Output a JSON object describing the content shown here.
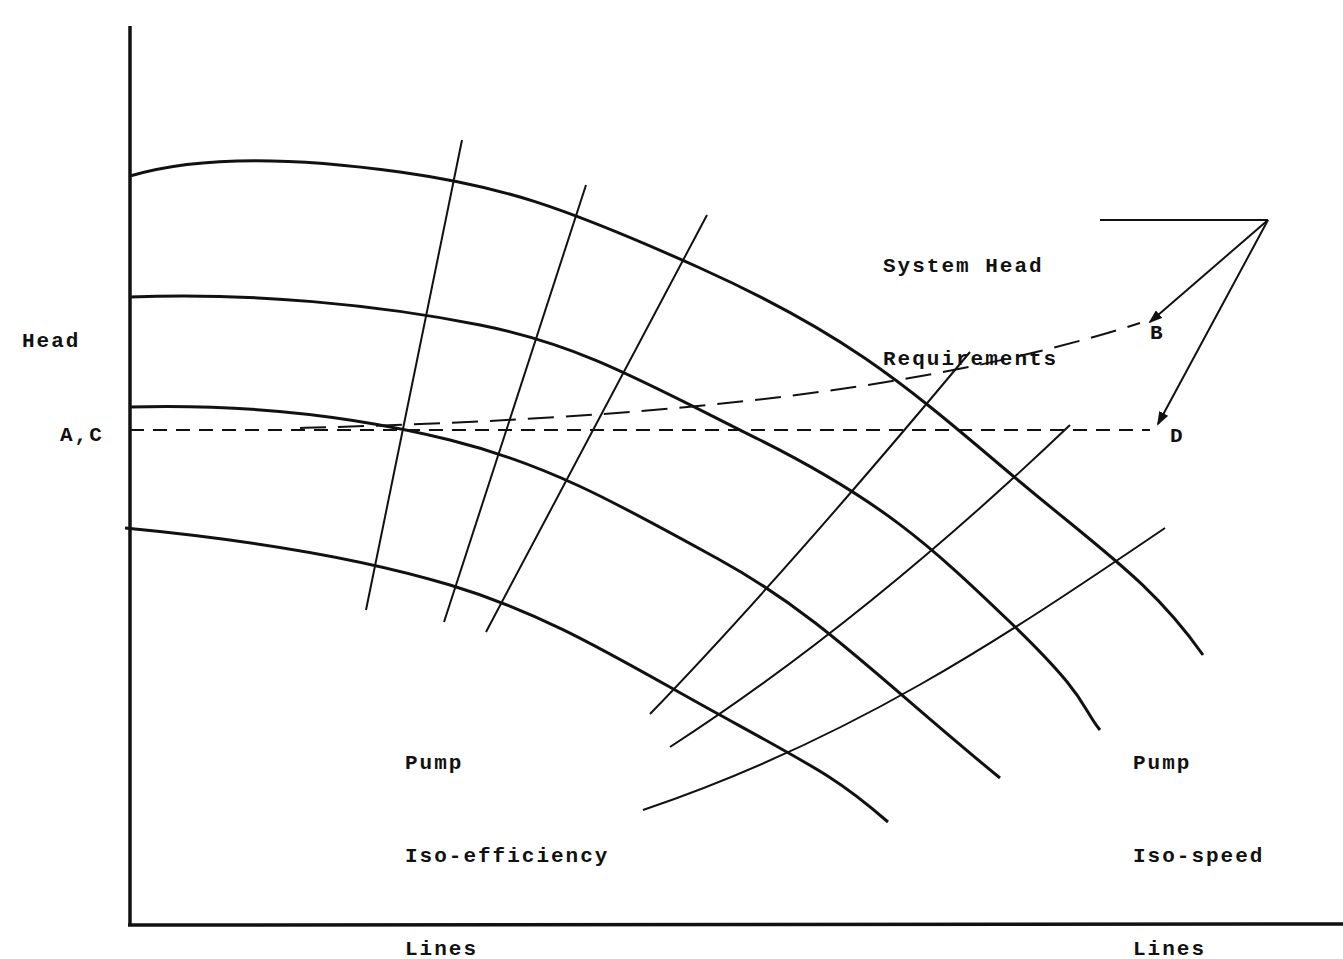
{
  "diagram": {
    "title": "",
    "axes": {
      "y_label": "Head",
      "x_label": "",
      "reference_level_label": "A,C"
    },
    "labels": {
      "system_head": [
        "System Head",
        "Requirements"
      ],
      "iso_efficiency": [
        "Pump",
        "Iso-efficiency",
        "Lines"
      ],
      "iso_speed": [
        "Pump",
        "Iso-speed",
        "Lines"
      ],
      "point_b": "B",
      "point_d": "D"
    },
    "colors": {
      "ink": "#111111",
      "background": "#ffffff"
    },
    "curves": {
      "iso_speed": [
        "M130,176 C200,155 300,158 400,172 S560,205 700,268 S900,380 1000,465 S1150,580 1203,655",
        "M130,297 C250,292 380,305 480,325 S640,380 760,440 S930,545 1010,622 S1080,705 1100,730",
        "M130,407 C240,404 350,415 450,440 S620,505 720,560 S880,680 1000,778",
        "M125,528 C230,538 350,555 450,585 S620,660 720,715 S840,780 888,822"
      ],
      "iso_efficiency": [
        "M462,140 L366,610",
        "M586,185 L444,622",
        "M707,215 L486,632",
        "M970,352 C880,460 760,600 650,714",
        "M1070,425 C960,530 820,650 670,747",
        "M1165,528 C1000,640 850,740 643,810"
      ],
      "system_b": "M300,428 C600,420 900,400 1140,323",
      "system_d": "M130,430 L1150,430",
      "leader": "M1100,220 L1268,220",
      "arrow_b": "M1268,220 L1150,322",
      "arrow_d": "M1268,220 L1158,424"
    }
  }
}
